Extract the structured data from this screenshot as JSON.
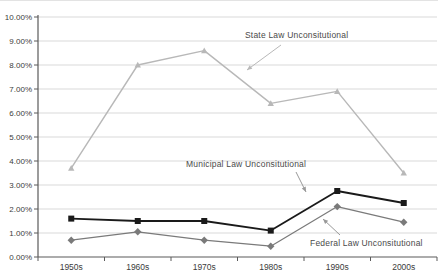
{
  "chart_data": {
    "type": "line",
    "title": "",
    "categories": [
      "1950s",
      "1960s",
      "1970s",
      "1980s",
      "1990s",
      "2000s"
    ],
    "series": [
      {
        "name": "Federal Law Unconsitutional",
        "values": [
          0.7,
          1.05,
          0.7,
          0.45,
          2.1,
          1.45
        ],
        "color": "#7a7a7a",
        "marker": "diamond"
      },
      {
        "name": "Municipal Law Unconsitutional",
        "values": [
          1.6,
          1.5,
          1.5,
          1.1,
          2.75,
          2.25
        ],
        "color": "#1a1a1a",
        "marker": "square"
      },
      {
        "name": "State Law Unconsitutional",
        "values": [
          3.7,
          8.0,
          8.6,
          6.4,
          6.9,
          3.5
        ],
        "color": "#b8b8b8",
        "marker": "triangle"
      }
    ],
    "ylim": [
      0,
      10
    ],
    "y_tick_step": 1,
    "y_tick_labels": [
      "0.00%",
      "1.00%",
      "2.00%",
      "3.00%",
      "4.00%",
      "5.00%",
      "6.00%",
      "7.00%",
      "8.00%",
      "9.00%",
      "10.00%"
    ],
    "xlabel": "",
    "ylabel": "",
    "grid": true,
    "legend_position": "none",
    "label_style": "inline-annotations-with-leader-arrows",
    "axis_color": "#5a5a5a",
    "gridline_color": "#d9d9d9",
    "text_color": "#3c3c3c"
  }
}
